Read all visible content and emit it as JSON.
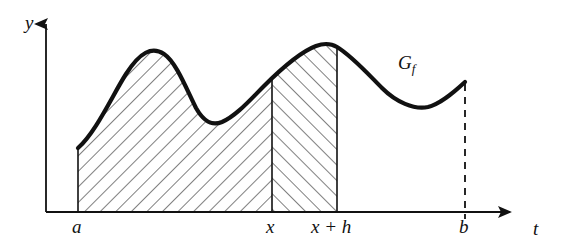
{
  "figure": {
    "background_color": "#ffffff",
    "ink_color": "#111111",
    "hatch_color": "#555555"
  },
  "axes": {
    "y_axis": {
      "label": "y",
      "x": 46,
      "top": 18,
      "bottom": 212,
      "arrow": "up"
    },
    "x_axis": {
      "label": "t",
      "y": 212,
      "left": 46,
      "right": 522,
      "arrow": "right"
    }
  },
  "tick_labels": [
    {
      "name": "a",
      "text": "a",
      "x": 72,
      "y": 216
    },
    {
      "name": "x",
      "text": "x",
      "x": 266,
      "y": 216
    },
    {
      "name": "x-plus-h",
      "text": "x + h",
      "x": 315,
      "y": 216
    },
    {
      "name": "b",
      "text": "b",
      "x": 459,
      "y": 216
    }
  ],
  "curve": {
    "label": "G",
    "label_subscript": "f",
    "label_x": 398,
    "label_y": 54,
    "stroke_width": 4.2,
    "path": "M 78,148 C 96,132 112,96 126,74 C 140,52 152,46 164,54 C 176,62 186,88 196,108 C 204,122 212,126 222,122 C 236,116 250,100 264,86 C 282,68 300,52 316,46 C 324,43 332,44 337,47 C 352,56 368,74 382,88 C 396,102 414,110 428,107 C 440,104 452,94 465,82"
  },
  "regions": [
    {
      "name": "region-a-to-x",
      "from_label": "a",
      "to_label": "x",
      "hatch_direction": "down-right",
      "x_start": 78,
      "x_end": 272
    },
    {
      "name": "region-x-to-x-plus-h",
      "from_label": "x",
      "to_label": "x + h",
      "hatch_direction": "up-right",
      "x_start": 272,
      "x_end": 337
    }
  ],
  "vertical_lines": [
    {
      "name": "line-at-a",
      "x": 78,
      "top": 148,
      "bottom": 212,
      "style": "solid"
    },
    {
      "name": "line-at-x",
      "x": 272,
      "top": 92,
      "bottom": 212,
      "style": "solid"
    },
    {
      "name": "line-at-x-plus-h",
      "x": 337,
      "top": 47,
      "bottom": 212,
      "style": "solid"
    },
    {
      "name": "line-at-b",
      "x": 465,
      "top": 84,
      "bottom": 219,
      "style": "dashed"
    }
  ]
}
